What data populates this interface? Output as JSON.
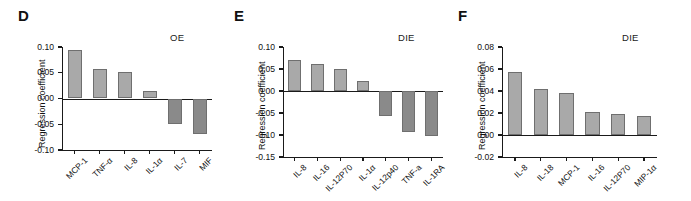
{
  "figure": {
    "ylabel": "Regression coefficient"
  },
  "chart_data": [
    {
      "type": "bar",
      "panel": "D",
      "title": "OE",
      "xlabel": "",
      "ylabel": "Regression coefficient",
      "categories": [
        "MCP-1",
        "TNF-α",
        "IL-8",
        "IL-1α",
        "IL-7",
        "MIF"
      ],
      "values": [
        0.094,
        0.058,
        0.052,
        0.015,
        -0.049,
        -0.068
      ],
      "ylim": [
        -0.1,
        0.1
      ],
      "yticks": [
        0.1,
        0.05,
        0.0,
        -0.05,
        -0.1
      ],
      "ytick_labels": [
        "0.10",
        "0.05",
        "0.00",
        "-0.05",
        "-0.10"
      ],
      "grid": false,
      "legend": "none",
      "positive_color": "#a9a9a9",
      "negative_color": "#8a8a8a"
    },
    {
      "type": "bar",
      "panel": "E",
      "title": "DIE",
      "xlabel": "",
      "ylabel": "Regression coefficient",
      "categories": [
        "IL-8",
        "IL-16",
        "IL-12P70",
        "IL-1α",
        "IL-12p40",
        "TNF-a",
        "IL-1RA"
      ],
      "values": [
        0.07,
        0.062,
        0.051,
        0.023,
        -0.056,
        -0.093,
        -0.102
      ],
      "ylim": [
        -0.15,
        0.1
      ],
      "yticks": [
        0.1,
        0.05,
        0.0,
        -0.05,
        -0.1,
        -0.15
      ],
      "ytick_labels": [
        "0.10",
        "0.05",
        "0.00",
        "-0.05",
        "-0.10",
        "-0.15"
      ],
      "grid": false,
      "legend": "none",
      "positive_color": "#a9a9a9",
      "negative_color": "#8a8a8a"
    },
    {
      "type": "bar",
      "panel": "F",
      "title": "DIE",
      "xlabel": "",
      "ylabel": "Regression coefficient",
      "categories": [
        "IL-8",
        "IL-18",
        "MCP-1",
        "IL-16",
        "IL-12P70",
        "MIP-1α"
      ],
      "values": [
        0.0575,
        0.042,
        0.038,
        0.021,
        0.0195,
        0.017
      ],
      "ylim": [
        -0.02,
        0.08
      ],
      "yticks": [
        0.08,
        0.06,
        0.04,
        0.02,
        0.0,
        -0.02
      ],
      "ytick_labels": [
        "0.08",
        "0.06",
        "0.04",
        "0.02",
        "0.00",
        "-0.02"
      ],
      "grid": false,
      "legend": "none",
      "positive_color": "#a9a9a9",
      "negative_color": "#8a8a8a"
    }
  ]
}
